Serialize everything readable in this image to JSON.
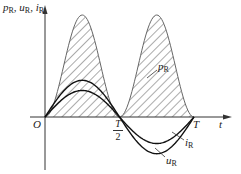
{
  "figure": {
    "y_axis_label": {
      "p": "p",
      "p_sub": "R",
      "u": "u",
      "u_sub": "R",
      "i": "i",
      "i_sub": "R",
      "sep": ", "
    },
    "x_axis_label": "t",
    "origin_label": "O",
    "tick_half": {
      "num": "T",
      "den": "2"
    },
    "tick_full": "T",
    "curve_labels": {
      "p": {
        "main": "p",
        "sub": "R"
      },
      "i": {
        "main": "i",
        "sub": "R"
      },
      "u": {
        "main": "u",
        "sub": "R"
      }
    }
  },
  "chart_data": {
    "type": "line",
    "title": "",
    "xlabel": "t",
    "ylabel": "pR, uR, iR",
    "x_ticks": [
      "O",
      "T/2",
      "T"
    ],
    "grid": false,
    "series": [
      {
        "name": "uR",
        "description": "voltage across resistor, sinusoid over one period T",
        "function": "Um·sin(2πt/T)",
        "relative_amplitude": 0.36
      },
      {
        "name": "iR",
        "description": "current through resistor, in phase with uR",
        "function": "Im·sin(2πt/T)",
        "relative_amplitude": 0.26
      },
      {
        "name": "pR",
        "description": "instantaneous power, always ≥ 0, twice the frequency, hatched area",
        "function": "Um·Im·sin²(2πt/T)",
        "relative_amplitude": 1.0
      }
    ],
    "annotations": [
      "hatched area under pR represents energy"
    ]
  }
}
